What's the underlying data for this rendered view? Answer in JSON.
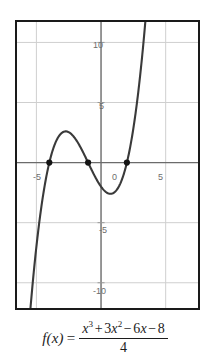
{
  "chart_data": {
    "type": "line",
    "title": "",
    "subtitle": "",
    "xlabel": "",
    "ylabel": "",
    "function": "f(x) = (x^3 + 3x^2 - 6x - 8) / 4",
    "xlim": [
      -6.5,
      7.5
    ],
    "ylim": [
      -12.1,
      11.7
    ],
    "grid": true,
    "legend": null,
    "x_ticks": [
      -5,
      0,
      5
    ],
    "x_tick_labels": [
      "-5",
      "0",
      "5"
    ],
    "y_ticks": [
      -10,
      -5,
      5,
      10
    ],
    "y_tick_labels": [
      "-10",
      "-5",
      "5",
      "10"
    ],
    "series": [
      {
        "name": "f(x)",
        "color": "#3a3a3a",
        "x": [
          -6.5,
          -6.25,
          -6,
          -5.75,
          -5.5,
          -5.25,
          -5,
          -4.75,
          -4.5,
          -4.25,
          -4,
          -3.75,
          -3.5,
          -3.25,
          -3,
          -2.75,
          -2.5,
          -2.25,
          -2,
          -1.75,
          -1.5,
          -1.25,
          -1,
          -0.75,
          -0.5,
          -0.25,
          0,
          0.25,
          0.5,
          0.75,
          1,
          1.25,
          1.5,
          1.75,
          2,
          2.25,
          2.5,
          2.75,
          3,
          3.25,
          3.5,
          3.75,
          4
        ],
        "y": [
          -19.09,
          -16.41,
          -13.99,
          -11.82,
          -9.88,
          -8.17,
          -6.67,
          -5.38,
          -4.28,
          -3.36,
          -2.63,
          -2.05,
          -1.63,
          -1.36,
          -1.22,
          -1.21,
          -1.31,
          -1.52,
          -1.82,
          -2.21,
          -2.67,
          -3.19,
          -3.77,
          -4.4,
          -5.06,
          -5.75,
          -6.46,
          -7.18,
          -7.9,
          -8.62,
          -9.32,
          -10,
          -10.64,
          -11.24,
          -11.79,
          -12.28,
          -12.69,
          -13.02,
          -13.25,
          -13.38,
          -13.39,
          -13.27,
          -13.01
        ]
      }
    ],
    "marked_points": [
      {
        "label": "root-x-minus-4",
        "x": -4,
        "y": 0
      },
      {
        "label": "root-x-minus-1",
        "x": -1,
        "y": 0
      },
      {
        "label": "root-x-2",
        "x": 2,
        "y": 0
      }
    ],
    "colors": {
      "curve": "#3a3a3a",
      "axis": "#6b6b6b",
      "grid": "#cfcfcf",
      "frame": "#1a1a1a",
      "tick_text": "#6d6d6d",
      "point_marker": "#141414",
      "background": "#ffffff"
    }
  },
  "caption": {
    "fn": "f(x)",
    "equals": "=",
    "numerator_parts": {
      "x": "x",
      "cube": "3",
      "plus": "+",
      "three": "3",
      "x2": "x",
      "square": "2",
      "minus1": "−",
      "six": "6",
      "x3": "x",
      "minus2": "−",
      "eight": "8"
    },
    "denominator": "4",
    "full_text": "f(x) = (x³ + 3x² − 6x − 8) / 4"
  },
  "axis_labels": {
    "y_10": "10",
    "y_5": "5",
    "x_neg5": "-5",
    "origin": "0",
    "x_5": "5",
    "y_neg5": "-5",
    "y_neg10": "-10"
  }
}
